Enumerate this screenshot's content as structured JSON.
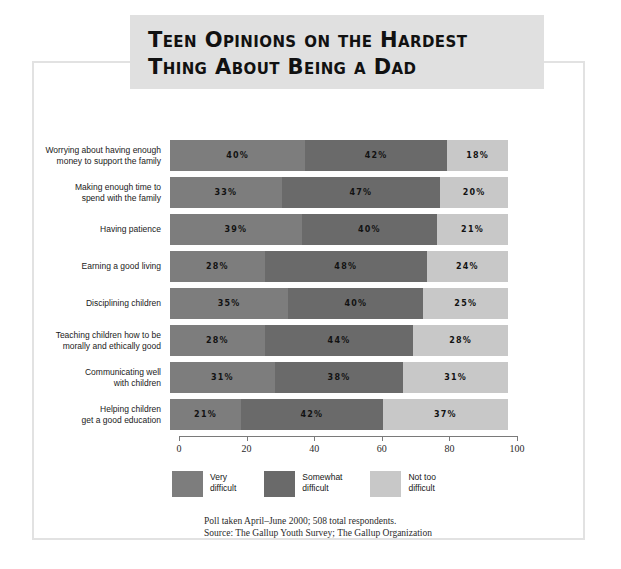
{
  "title": {
    "line1": "Teen Opinions on the Hardest",
    "line2": "Thing About Being a Dad"
  },
  "colors": {
    "very_difficult": "#7d7d7d",
    "somewhat_difficult": "#6a6a6a",
    "not_too_difficult": "#c8c8c8",
    "banner_bg": "#e0e0e0",
    "frame_border": "#e2e2e2",
    "axis": "#7a7a7a"
  },
  "footer": {
    "line1": "Poll taken April–June 2000; 508 total respondents.",
    "line2": "Source: The Gallup Youth Survey; The Gallup Organization"
  },
  "chart_data": {
    "type": "bar",
    "title": "Teen Opinions on the Hardest Thing About Being a Dad",
    "subtitle": "",
    "orientation": "horizontal",
    "stacked": true,
    "xlabel": "",
    "ylabel": "",
    "xlim": [
      0,
      100
    ],
    "xticks": [
      0,
      20,
      40,
      60,
      80,
      100
    ],
    "grid": false,
    "legend_position": "bottom",
    "categories": [
      "Worrying about having enough\nmoney to support the family",
      "Making enough time to\nspend with the family",
      "Having patience",
      "Earning a good living",
      "Disciplining children",
      "Teaching children how to be\nmorally and ethically good",
      "Communicating well\nwith children",
      "Helping children\nget a good education"
    ],
    "series": [
      {
        "name": "Very\ndifficult",
        "legend_label": "Very\ndifficult",
        "color": "#7d7d7d",
        "values": [
          40,
          33,
          39,
          28,
          35,
          28,
          31,
          21
        ],
        "labels": [
          "40%",
          "33%",
          "39%",
          "28%",
          "35%",
          "28%",
          "31%",
          "21%"
        ]
      },
      {
        "name": "Somewhat\ndifficult",
        "legend_label": "Somewhat\ndifficult",
        "color": "#6a6a6a",
        "values": [
          42,
          47,
          40,
          48,
          40,
          44,
          38,
          42
        ],
        "labels": [
          "42%",
          "47%",
          "40%",
          "48%",
          "40%",
          "44%",
          "38%",
          "42%"
        ]
      },
      {
        "name": "Not too\ndifficult",
        "legend_label": "Not too\ndifficult",
        "color": "#c8c8c8",
        "values": [
          18,
          20,
          21,
          24,
          25,
          28,
          31,
          37
        ],
        "labels": [
          "18%",
          "20%",
          "21%",
          "24%",
          "25%",
          "28%",
          "31%",
          "37%"
        ]
      }
    ]
  }
}
